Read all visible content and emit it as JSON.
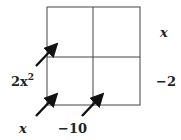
{
  "diagram": {
    "type": "area-model-grid",
    "grid": {
      "rows": 2,
      "cols": 2,
      "cells": [
        "",
        "",
        "",
        ""
      ]
    },
    "right_labels": [
      "x",
      "−2"
    ],
    "left_label": {
      "base": "2x",
      "exp": "2"
    },
    "bottom_labels": [
      "x",
      "−10"
    ],
    "arrows": 3,
    "colors": {
      "line": "#444444",
      "arrow": "#111111",
      "text": "#222222"
    }
  }
}
